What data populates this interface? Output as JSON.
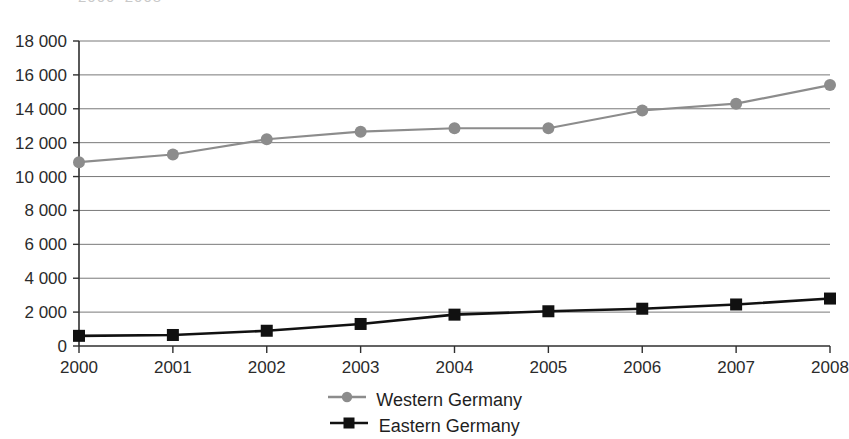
{
  "title_clipped": "2000–2008",
  "colors": {
    "western": "#8c8c8c",
    "eastern": "#111111",
    "grid": "#6a6a6a",
    "axis": "#2f2f2f",
    "background": "#ffffff"
  },
  "legend": {
    "items": [
      {
        "label": "Western Germany",
        "color": "#8c8c8c",
        "marker": "circle-marker-icon"
      },
      {
        "label": "Eastern Germany",
        "color": "#111111",
        "marker": "square-marker-icon"
      }
    ]
  },
  "axes": {
    "y_ticks": [
      "18 000",
      "16 000",
      "14 000",
      "12 000",
      "10 000",
      "8 000",
      "6 000",
      "4 000",
      "2 000",
      "0"
    ],
    "x_ticks": [
      "2000",
      "2001",
      "2002",
      "2003",
      "2004",
      "2005",
      "2006",
      "2007",
      "2008"
    ]
  },
  "chart_data": {
    "type": "line",
    "title": "2000–2008",
    "xlabel": "",
    "ylabel": "",
    "categories": [
      2000,
      2001,
      2002,
      2003,
      2004,
      2005,
      2006,
      2007,
      2008
    ],
    "x": [
      2000,
      2001,
      2002,
      2003,
      2004,
      2005,
      2006,
      2007,
      2008
    ],
    "ylim": [
      0,
      18000
    ],
    "xlim": [
      2000,
      2008
    ],
    "ytick_values": [
      0,
      2000,
      4000,
      6000,
      8000,
      10000,
      12000,
      14000,
      16000,
      18000
    ],
    "grid": "horizontal",
    "legend_position": "bottom-center",
    "series": [
      {
        "name": "Western Germany",
        "color": "#8c8c8c",
        "marker": "circle",
        "values": [
          10850,
          11300,
          12200,
          12650,
          12850,
          12850,
          13900,
          14300,
          15400
        ]
      },
      {
        "name": "Eastern Germany",
        "color": "#111111",
        "marker": "square",
        "values": [
          600,
          650,
          900,
          1300,
          1850,
          2050,
          2200,
          2450,
          2800
        ]
      }
    ]
  }
}
